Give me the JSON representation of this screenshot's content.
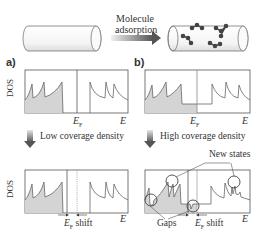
{
  "top": {
    "arrow_label_line1": "Molecule",
    "arrow_label_line2": "adsorption"
  },
  "panels": {
    "a": {
      "label": "a)",
      "ylabel": "DOS",
      "ef_label": "E",
      "ef_sub": "F",
      "e_label": "E"
    },
    "b": {
      "label": "b)",
      "ef_label": "E",
      "ef_sub": "F",
      "e_label": "E"
    }
  },
  "transitions": {
    "low": "Low coverage density",
    "high": "High coverage density"
  },
  "bottom": {
    "a": {
      "ylabel": "DOS",
      "shift_label_e": "E",
      "shift_label_sub": "F",
      "shift_label_rest": " shift",
      "e_label": "E"
    },
    "b": {
      "new_states": "New states",
      "gaps": "Gaps",
      "shift_label_e": "E",
      "shift_label_sub": "F",
      "shift_label_rest": " shift",
      "e_label": "E"
    }
  },
  "colors": {
    "line": "#555555",
    "fill": "#d4d4d4",
    "arrow_gradient_start": "#e8e8e8",
    "arrow_gradient_end": "#555555"
  }
}
